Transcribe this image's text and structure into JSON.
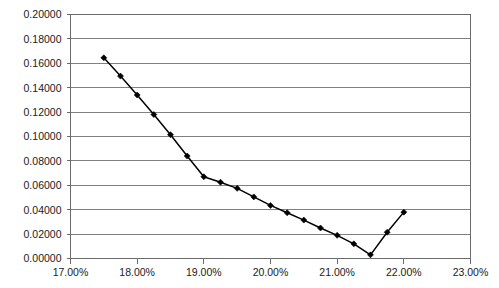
{
  "chart_data": {
    "type": "line",
    "title": "",
    "subtitle": "",
    "xlabel": "",
    "ylabel": "",
    "xlim": [
      0.17,
      0.23
    ],
    "ylim": [
      0.0,
      0.2
    ],
    "grid": true,
    "grid_axis": "y",
    "legend": false,
    "legend_position": "none",
    "x_tick_labels": [
      "17.00%",
      "18.00%",
      "19.00%",
      "20.00%",
      "21.00%",
      "22.00%",
      "23.00%"
    ],
    "x_tick_values": [
      0.17,
      0.18,
      0.19,
      0.2,
      0.21,
      0.22,
      0.23
    ],
    "y_tick_labels": [
      "0.00000",
      "0.02000",
      "0.04000",
      "0.06000",
      "0.08000",
      "0.10000",
      "0.12000",
      "0.14000",
      "0.16000",
      "0.18000",
      "0.20000"
    ],
    "y_tick_values": [
      0.0,
      0.02,
      0.04,
      0.06,
      0.08,
      0.1,
      0.12,
      0.14,
      0.16,
      0.18,
      0.2
    ],
    "series": [
      {
        "name": "",
        "color": "#000000",
        "marker": "diamond",
        "x": [
          0.175,
          0.1775,
          0.18,
          0.1825,
          0.185,
          0.1875,
          0.19,
          0.1925,
          0.195,
          0.1975,
          0.2,
          0.2025,
          0.205,
          0.2075,
          0.21,
          0.2125,
          0.215,
          0.2175,
          0.22
        ],
        "values": [
          0.1645,
          0.1495,
          0.134,
          0.118,
          0.1015,
          0.084,
          0.067,
          0.0625,
          0.0575,
          0.0505,
          0.0435,
          0.0375,
          0.0315,
          0.025,
          0.019,
          0.012,
          0.003,
          0.0215,
          0.038
        ]
      }
    ],
    "points_count": 19
  }
}
